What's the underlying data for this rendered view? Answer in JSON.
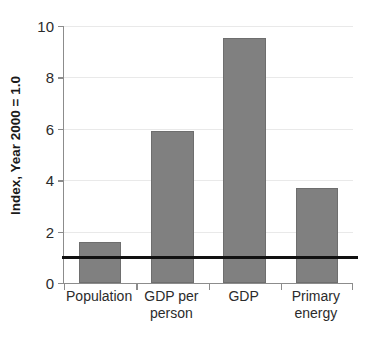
{
  "chart_data": {
    "type": "bar",
    "title": "",
    "xlabel": "",
    "ylabel": "Index, Year 2000 = 1.0",
    "categories": [
      "Population",
      "GDP per person",
      "GDP",
      "Primary energy"
    ],
    "values": [
      1.6,
      5.9,
      9.55,
      3.7
    ],
    "ylim": [
      0,
      10
    ],
    "yticks": [
      0,
      2,
      4,
      6,
      8,
      10
    ],
    "ytick_labels": [
      "0",
      "2",
      "4",
      "6",
      "8",
      "10"
    ],
    "grid": true,
    "legend": "none",
    "bar_color": "#808080",
    "bar_edge_color": "#6e6e6e",
    "gridline_color": "#e9e9e9",
    "axis_color": "#8c8c8c",
    "annotations": [
      {
        "name": "baseline-reference-line",
        "type": "hline",
        "value": 1.0,
        "color": "#111111",
        "label": ""
      }
    ]
  },
  "axis": {
    "y_title": "Index, Year 2000 = 1.0",
    "ticks": [
      {
        "label": "10",
        "value": 10
      },
      {
        "label": "8",
        "value": 8
      },
      {
        "label": "6",
        "value": 6
      },
      {
        "label": "4",
        "value": 4
      },
      {
        "label": "2",
        "value": 2
      },
      {
        "label": "0",
        "value": 0
      }
    ]
  },
  "categories": [
    {
      "label": "Population",
      "value": 1.6
    },
    {
      "label": "GDP per person",
      "value": 5.9
    },
    {
      "label": "GDP",
      "value": 9.55
    },
    {
      "label": "Primary energy",
      "value": 3.7
    }
  ]
}
